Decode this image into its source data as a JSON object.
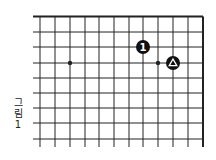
{
  "figure": {
    "caption_chars": [
      "그",
      "림",
      "1"
    ],
    "caption": "그림 1"
  },
  "board": {
    "line_color": "#222222",
    "stone_color": "#111111",
    "x_lines": [
      40,
      55,
      70,
      85,
      99,
      114,
      129,
      143,
      158,
      173,
      188,
      203
    ],
    "y_lines": [
      16.5,
      32,
      47,
      63,
      78,
      93,
      108,
      123,
      139
    ],
    "left_extent": 33,
    "bottom_extent": 147,
    "top_edge": 16.5,
    "right_edge": 203,
    "star_points": [
      {
        "x": 70,
        "y": 63
      },
      {
        "x": 158,
        "y": 63
      }
    ],
    "stones": [
      {
        "x": 143,
        "y": 47,
        "color": "black",
        "marker": "number",
        "label": "1"
      },
      {
        "x": 173,
        "y": 63,
        "color": "black",
        "marker": "triangle",
        "label": ""
      }
    ]
  }
}
